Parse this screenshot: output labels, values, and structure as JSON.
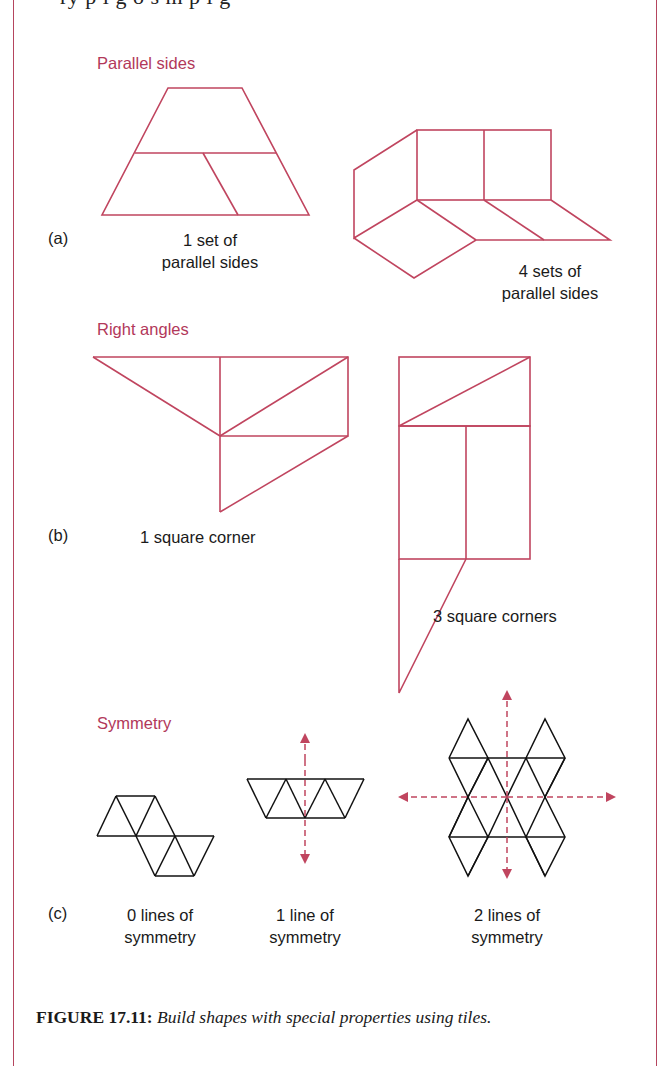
{
  "header_clipped_text": "ry p i g  o  s  m  p  i g",
  "sections": {
    "a": {
      "label": "(a)",
      "heading": "Parallel sides",
      "left_caption_line1": "1 set of",
      "left_caption_line2": "parallel sides",
      "right_caption_line1": "4 sets of",
      "right_caption_line2": "parallel sides"
    },
    "b": {
      "label": "(b)",
      "heading": "Right angles",
      "left_caption": "1 square corner",
      "right_caption": "3 square corners"
    },
    "c": {
      "label": "(c)",
      "heading": "Symmetry",
      "captions": [
        {
          "line1": "0 lines of",
          "line2": "symmetry"
        },
        {
          "line1": "1 line of",
          "line2": "symmetry"
        },
        {
          "line1": "2 lines of",
          "line2": "symmetry"
        }
      ]
    }
  },
  "caption": {
    "figure_number": "FIGURE 17.11:",
    "text": "Build shapes with special properties using tiles."
  },
  "colors": {
    "accent": "#b2385a",
    "shape_stroke": "#c0455f",
    "tile_stroke": "#111111",
    "frame": "#b5455e"
  }
}
